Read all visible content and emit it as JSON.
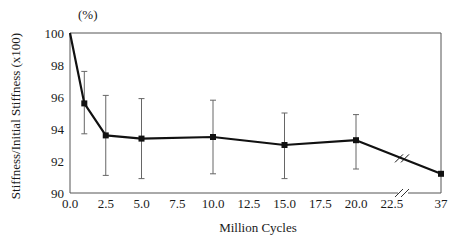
{
  "chart_data": {
    "type": "line",
    "title": "",
    "unit_label": "(%)",
    "xlabel": "Million Cycles",
    "ylabel": "Stiffness/Initial Stiffness (x100)",
    "ylim": [
      90,
      100
    ],
    "y_ticks": [
      90,
      92,
      94,
      96,
      98,
      100
    ],
    "x_ticks": [
      "0.0",
      "2.5",
      "5.0",
      "7.5",
      "10.0",
      "12.5",
      "15.0",
      "17.5",
      "20.0",
      "22.5",
      "37"
    ],
    "x_axis_break": "between 22.5 and 37",
    "grid": false,
    "legend": null,
    "series": [
      {
        "name": "Stiffness ratio",
        "x": [
          0.0,
          1.0,
          2.5,
          5.0,
          10.0,
          15.0,
          20.0,
          37
        ],
        "values": [
          100.0,
          95.6,
          93.6,
          93.4,
          93.5,
          93.0,
          93.3,
          91.2
        ],
        "error_upper": [
          null,
          97.6,
          96.1,
          95.9,
          95.8,
          95.0,
          94.9,
          null
        ],
        "error_lower": [
          null,
          93.7,
          91.1,
          90.9,
          91.2,
          90.9,
          91.5,
          null
        ]
      }
    ]
  },
  "labels": {
    "unit": "(%)",
    "xlabel": "Million Cycles",
    "ylabel": "Stiffness/Initial Stiffness (x100)"
  }
}
